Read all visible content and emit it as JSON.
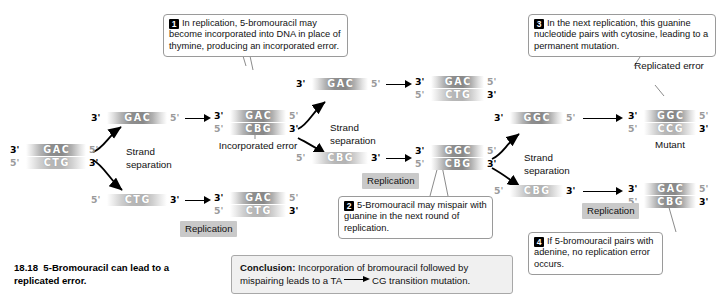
{
  "figure": {
    "number": "18.18",
    "caption": "5-Bromouracil can lead to a replicated error."
  },
  "callouts": [
    {
      "num": "1",
      "text": "In replication, 5-bromouracil may become incorporated into DNA in place of thymine, producing an incorporated error."
    },
    {
      "num": "2",
      "text": "5-Bromouracil may mispair with guanine in the next round of replication."
    },
    {
      "num": "3",
      "text": "In the next replication, this guanine nucleotide pairs with cytosine, leading to a permanent mutation."
    },
    {
      "num": "4",
      "text": "If 5-bromouracil pairs with adenine, no replication error occurs."
    }
  ],
  "conclusion": {
    "lead": "Conclusion:",
    "part1": " Incorporation of bromouracil followed by mispairing leads to a TA",
    "part2": "CG transition mutation."
  },
  "labels": {
    "strand_separation_1": "Strand separation",
    "strand_separation_2": "Strand separation",
    "strand_separation_3": "Strand separation",
    "replication_1": "Replication",
    "replication_2": "Replication",
    "replication_3": "Replication",
    "incorporated_error": "Incorporated error",
    "replicated_error": "Replicated error",
    "mutant": "Mutant"
  },
  "ends": {
    "three": "3'",
    "five": "5'"
  },
  "duplexes": {
    "original": {
      "top_seq": "GAC",
      "bottom_seq": "CTG",
      "top_left": "3'",
      "top_right": "5'",
      "bottom_left": "5'",
      "bottom_right": "3'"
    },
    "incorporated": {
      "top_seq": "GAC",
      "bottom_seq": "CBG",
      "top_left": "3'",
      "top_right": "5'",
      "bottom_left": "5'",
      "bottom_right": "3'"
    },
    "normal_top": {
      "top_seq": "GAC",
      "bottom_seq": "CTG",
      "top_left": "3'",
      "top_right": "5'",
      "bottom_left": "5'",
      "bottom_right": "3'"
    },
    "mispaired": {
      "top_seq": "GGC",
      "bottom_seq": "CBG",
      "top_left": "3'",
      "top_right": "5'",
      "bottom_left": "5'",
      "bottom_right": "3'"
    },
    "mutant": {
      "top_seq": "GGC",
      "bottom_seq": "CCG",
      "top_left": "3'",
      "top_right": "5'",
      "bottom_left": "5'",
      "bottom_right": "3'"
    },
    "restored": {
      "top_seq": "GAC",
      "bottom_seq": "CBG",
      "top_left": "3'",
      "top_right": "5'",
      "bottom_left": "5'",
      "bottom_right": "3'"
    }
  },
  "singles": {
    "gac_1": {
      "seq": "GAC",
      "left": "3'",
      "right": "5'"
    },
    "ctg_1": {
      "seq": "CTG",
      "left": "5'",
      "right": "3'"
    },
    "gac_2": {
      "seq": "GAC",
      "left": "3'",
      "right": "5'"
    },
    "cbg_2": {
      "seq": "CBG",
      "left": "5'",
      "right": "3'"
    },
    "ggc_3": {
      "seq": "GGC",
      "left": "3'",
      "right": "5'"
    },
    "cbg_3": {
      "seq": "CBG",
      "left": "5'",
      "right": "3'"
    }
  },
  "colors": {
    "strand_dark": "#898989",
    "strand_light": "#b4b4b4",
    "tag_bg": "#c9c9c9",
    "conclusion_bg": "#f0f0f0",
    "callout_border": "#9a9a9a",
    "badge_bg": "#000000"
  }
}
